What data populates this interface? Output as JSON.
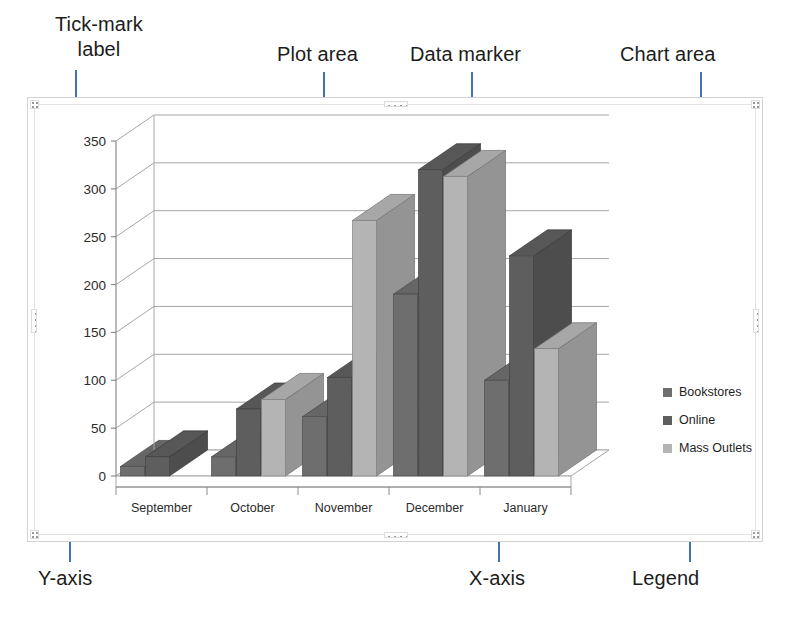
{
  "annotations": [
    {
      "name": "tick-mark-label",
      "text": "Tick-mark\nlabel"
    },
    {
      "name": "plot-area",
      "text": "Plot area"
    },
    {
      "name": "data-marker",
      "text": "Data marker"
    },
    {
      "name": "chart-area",
      "text": "Chart area"
    },
    {
      "name": "y-axis",
      "text": "Y-axis"
    },
    {
      "name": "x-axis",
      "text": "X-axis"
    },
    {
      "name": "legend",
      "text": "Legend"
    }
  ],
  "annotation_color": "#4472b8",
  "chart_data": {
    "type": "bar",
    "title": "",
    "xlabel": "",
    "ylabel": "",
    "categories": [
      "September",
      "October",
      "November",
      "December",
      "January"
    ],
    "series": [
      {
        "name": "Bookstores",
        "values": [
          10,
          20,
          62,
          190,
          100
        ],
        "color": "#6e6e6e"
      },
      {
        "name": "Online",
        "values": [
          20,
          70,
          103,
          320,
          230
        ],
        "color": "#5e5e5e"
      },
      {
        "name": "Mass Outlets",
        "values": [
          0,
          80,
          267,
          313,
          133
        ],
        "color": "#b4b4b4"
      }
    ],
    "ylim": [
      0,
      350
    ],
    "yticks": [
      0,
      50,
      100,
      150,
      200,
      250,
      300,
      350
    ],
    "ytick_labels": [
      "0",
      "50",
      "100",
      "150",
      "200",
      "250",
      "300",
      "350"
    ],
    "grid": true,
    "legend_position": "right",
    "threed": true
  },
  "legend": {
    "items": [
      {
        "label": "Bookstores",
        "color": "#6e6e6e"
      },
      {
        "label": "Online",
        "color": "#5e5e5e"
      },
      {
        "label": "Mass Outlets",
        "color": "#b4b4b4"
      }
    ]
  }
}
